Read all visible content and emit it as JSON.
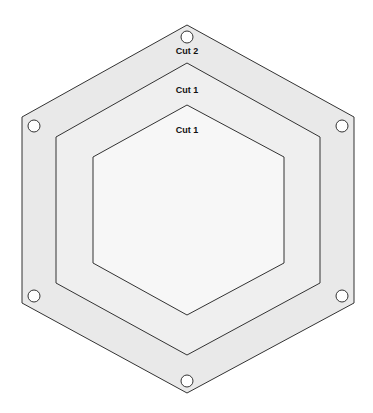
{
  "diagram": {
    "labels": {
      "outer_band": "Cut 2",
      "middle_band": "Cut 1",
      "inner_hexagon": "Cut 1"
    },
    "colors": {
      "outer_fill": "#e9e9e9",
      "middle_fill": "#efefef",
      "inner_fill": "#f7f7f7",
      "stroke": "#333333",
      "hole_fill": "#ffffff"
    },
    "hexagons": [
      {
        "name": "outer",
        "points": "187,25 354,117 354,303 187,393 22,303 22,117"
      },
      {
        "name": "middle",
        "points": "187,63 320,137 320,283 187,355 56,283 56,137"
      },
      {
        "name": "inner",
        "points": "187,105 284,157 284,263 187,315 93,263 93,157"
      }
    ],
    "holes": [
      {
        "cx": 187,
        "cy": 37
      },
      {
        "cx": 342,
        "cy": 126
      },
      {
        "cx": 342,
        "cy": 296
      },
      {
        "cx": 187,
        "cy": 381
      },
      {
        "cx": 34,
        "cy": 296
      },
      {
        "cx": 34,
        "cy": 126
      }
    ]
  }
}
